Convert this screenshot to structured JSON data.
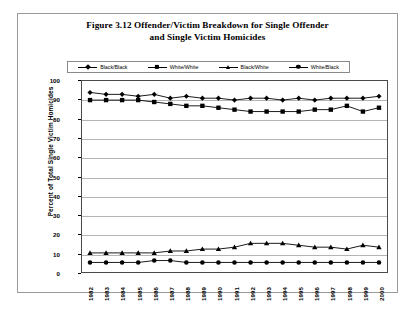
{
  "figure": {
    "title_line1": "Figure 3.12 Offender/Victim Breakdown for Single Offender",
    "title_line2": "and Single Victim Homicides"
  },
  "chart_data": {
    "type": "line",
    "title": "Figure 3.12 Offender/Victim Breakdown for Single Offender and Single Victim Homicides",
    "xlabel": "",
    "ylabel": "Percent of Total Single Victim Homicides",
    "ylim": [
      0,
      100
    ],
    "ytick_step": 10,
    "yticks": [
      0,
      10,
      20,
      30,
      40,
      50,
      60,
      70,
      80,
      90,
      100
    ],
    "grid": true,
    "legend_position": "top",
    "categories": [
      "1982",
      "1983",
      "1984",
      "1985",
      "1986",
      "1987",
      "1988",
      "1989",
      "1990",
      "1991",
      "1992",
      "1993",
      "1994",
      "1995",
      "1996",
      "1997",
      "1998",
      "1999",
      "2000"
    ],
    "series": [
      {
        "name": "Black/Black",
        "marker": "diamond",
        "color": "#000000",
        "values": [
          94,
          93,
          93,
          92,
          93,
          91,
          92,
          91,
          91,
          90,
          91,
          91,
          90,
          91,
          90,
          91,
          91,
          91,
          92
        ]
      },
      {
        "name": "White/White",
        "marker": "square",
        "color": "#000000",
        "values": [
          90,
          90,
          90,
          90,
          89,
          88,
          87,
          87,
          86,
          85,
          84,
          84,
          84,
          84,
          85,
          85,
          87,
          84,
          86
        ]
      },
      {
        "name": "Black/White",
        "marker": "triangle",
        "color": "#000000",
        "values": [
          10,
          10,
          10,
          10,
          10,
          11,
          11,
          12,
          12,
          13,
          15,
          15,
          15,
          14,
          13,
          13,
          12,
          14,
          13
        ]
      },
      {
        "name": "White/Black",
        "marker": "circle",
        "color": "#000000",
        "values": [
          5,
          5,
          5,
          5,
          6,
          6,
          5,
          5,
          5,
          5,
          5,
          5,
          5,
          5,
          5,
          5,
          5,
          5,
          5
        ]
      }
    ]
  },
  "legend": {
    "items": [
      {
        "label": "Black/Black",
        "marker": "diamond-marker-icon"
      },
      {
        "label": "White/White",
        "marker": "square-marker-icon"
      },
      {
        "label": "Black/White",
        "marker": "triangle-marker-icon"
      },
      {
        "label": "White/Black",
        "marker": "circle-marker-icon"
      }
    ]
  },
  "colors": {
    "series": "#000000",
    "gridline": "#b4b4b4",
    "frame": "#4a4a4a",
    "figure_border": "#9a9a9a",
    "background": "#ffffff"
  }
}
